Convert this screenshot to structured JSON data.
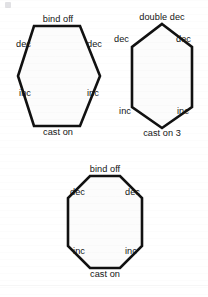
{
  "page": {
    "background_color": "#ffffff",
    "stroke_color": "#111111",
    "fill_color": "#fcfcfc",
    "text_color": "#141414",
    "width": 208,
    "height": 297
  },
  "figures": [
    {
      "id": "hexagon-flat-top",
      "shape": "hexagon",
      "orientation": "flat-top",
      "labels": {
        "top": "bind off",
        "upper_left": "dec",
        "upper_right": "dec",
        "lower_left": "inc",
        "lower_right": "inc",
        "bottom": "cast on"
      }
    },
    {
      "id": "hexagon-pointy-top",
      "shape": "hexagon",
      "orientation": "pointy-top",
      "labels": {
        "top": "double dec",
        "upper_left": "dec",
        "upper_right": "dec",
        "lower_left": "inc",
        "lower_right": "inc",
        "bottom": "cast on 3"
      }
    },
    {
      "id": "octagon",
      "shape": "octagon",
      "orientation": "flat-top",
      "labels": {
        "top": "bind off",
        "upper_left": "dec",
        "upper_right": "dec",
        "lower_left": "inc",
        "lower_right": "inc",
        "bottom": "cast on"
      }
    }
  ]
}
